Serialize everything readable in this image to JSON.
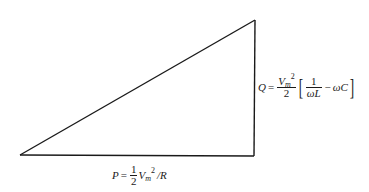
{
  "diagram": {
    "stroke_color": "#1a1a1a",
    "background": "#ffffff",
    "vertices": {
      "bottom_left": [
        20,
        155
      ],
      "bottom_right": [
        254,
        156
      ],
      "top_right": [
        255,
        20
      ]
    },
    "labels": {
      "reactive_power": {
        "symbol": "Q",
        "equals": "=",
        "coef_numerator": "V",
        "coef_numerator_sub": "m",
        "coef_numerator_sup": "2",
        "coef_denominator": "2",
        "bracket_open": "[",
        "inner_numerator": "1",
        "inner_denominator": "ωL",
        "minus": "−",
        "term": "ωC",
        "bracket_close": "]",
        "full_text": "Q = (Vm^2 / 2) [ 1/(ωL) − ωC ]"
      },
      "real_power": {
        "symbol": "P",
        "equals": "=",
        "frac_numerator": "1",
        "frac_denominator": "2",
        "voltage": "V",
        "voltage_sub": "m",
        "voltage_sup": "2",
        "divide": "/",
        "resistance": "R",
        "full_text": "P = (1/2) Vm^2 / R"
      }
    }
  }
}
